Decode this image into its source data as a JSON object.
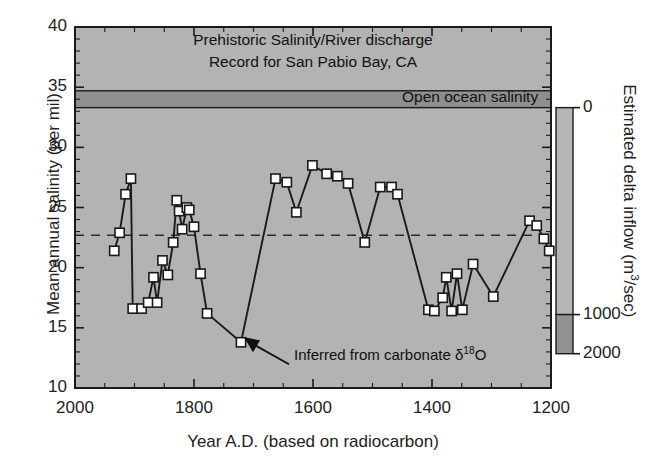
{
  "figure": {
    "title_line1": "Prehistoric Salinity/River discharge",
    "title_line2": "Record for San Pabio Bay, CA",
    "band_label": "Open ocean salinity",
    "annotation": "Inferred from carbonate ",
    "annotation_delta": "δ",
    "annotation_sup": "18",
    "annotation_tail": "O",
    "plot_bg": "#b3b3b3",
    "band_color": "#8f8f8f",
    "line_color": "#1a1a1a",
    "marker_face": "#ffffff",
    "marker_edge": "#1a1a1a",
    "colorbar_top": "#b5b5b5",
    "colorbar_bottom": "#919191"
  },
  "chart_data": {
    "type": "line",
    "title": "Prehistoric Salinity/River discharge Record for San Pabio Bay, CA",
    "xlabel": "Year A.D. (based on radiocarbon)",
    "ylabel": "Mean annual salinity (per mil)",
    "y2label": "Estimated delta inflow (m³/sec)",
    "xlim": [
      2000,
      1200
    ],
    "x_reversed": true,
    "ylim": [
      10,
      40
    ],
    "y2lim": [
      0,
      2000
    ],
    "grid": false,
    "legend": "none",
    "xticks": [
      2000,
      1800,
      1600,
      1400,
      1200
    ],
    "xtick_labels": [
      "2000",
      "1800",
      "1600",
      "1400",
      "1200"
    ],
    "x_minor_step": 50,
    "yticks": [
      10,
      15,
      20,
      25,
      30,
      35,
      40
    ],
    "ytick_labels": [
      "10",
      "15",
      "20",
      "25",
      "30",
      "35",
      "40"
    ],
    "y_minor_step": 1,
    "y2ticks": [
      0,
      1000,
      2000
    ],
    "y2tick_labels": [
      "0",
      "1000",
      "2000"
    ],
    "reference_line": {
      "label": "mean salinity",
      "y": 22.7,
      "style": "dashed"
    },
    "open_ocean_band": {
      "y_low": 33.3,
      "y_high": 34.7,
      "label": "Open ocean salinity"
    },
    "series": [
      {
        "name": "Mean annual salinity",
        "marker": "square",
        "points": [
          [
            1934,
            21.4
          ],
          [
            1925,
            22.9
          ],
          [
            1915,
            26.1
          ],
          [
            1906,
            27.4
          ],
          [
            1903,
            16.6
          ],
          [
            1888,
            16.6
          ],
          [
            1877,
            17.1
          ],
          [
            1868,
            19.2
          ],
          [
            1862,
            17.1
          ],
          [
            1853,
            20.6
          ],
          [
            1844,
            19.4
          ],
          [
            1835,
            22.1
          ],
          [
            1829,
            25.6
          ],
          [
            1825,
            24.7
          ],
          [
            1820,
            23.2
          ],
          [
            1812,
            25.0
          ],
          [
            1808,
            24.8
          ],
          [
            1800,
            23.4
          ],
          [
            1789,
            19.5
          ],
          [
            1778,
            16.2
          ],
          [
            1721,
            13.8
          ],
          [
            1663,
            27.4
          ],
          [
            1644,
            27.1
          ],
          [
            1628,
            24.6
          ],
          [
            1601,
            28.5
          ],
          [
            1577,
            27.8
          ],
          [
            1559,
            27.6
          ],
          [
            1541,
            27.0
          ],
          [
            1513,
            22.1
          ],
          [
            1487,
            26.7
          ],
          [
            1468,
            26.7
          ],
          [
            1458,
            26.1
          ],
          [
            1406,
            16.5
          ],
          [
            1396,
            16.4
          ],
          [
            1382,
            17.5
          ],
          [
            1376,
            19.2
          ],
          [
            1367,
            16.4
          ],
          [
            1358,
            19.5
          ],
          [
            1349,
            16.5
          ],
          [
            1331,
            20.3
          ],
          [
            1297,
            17.6
          ],
          [
            1236,
            23.9
          ],
          [
            1224,
            23.5
          ],
          [
            1212,
            22.4
          ],
          [
            1203,
            21.4
          ]
        ],
        "special_point": {
          "x": 1721,
          "y": 13.8,
          "note": "Inferred from carbonate δ18O"
        }
      }
    ]
  },
  "axes": {
    "y_title": "Mean annual salinity (per mil)",
    "x_title": "Year A.D. (based on radiocarbon)",
    "y2_title_a": "Estimated delta inflow (m",
    "y2_title_sup": "3",
    "y2_title_b": "/sec)"
  }
}
